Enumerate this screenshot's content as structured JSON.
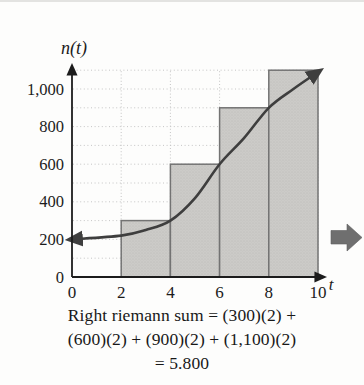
{
  "figure": {
    "caption_lines": [
      "Right riemann sum = (300)(2) +",
      "(600)(2) + (900)(2) + (1,100)(2)",
      "= 5.800"
    ]
  },
  "icons": {
    "continue_arrow": {
      "name": "right-block-arrow",
      "color": "#6f6f6f"
    }
  },
  "chart_data": {
    "type": "bar",
    "title": "",
    "xlabel": "t",
    "ylabel": "n(t)",
    "xlim": [
      0,
      10.3
    ],
    "ylim": [
      0,
      1150
    ],
    "x_ticks": {
      "values": [
        0,
        2,
        4,
        6,
        8,
        10
      ],
      "labels": [
        "0",
        "2",
        "4",
        "6",
        "8",
        "10"
      ]
    },
    "y_ticks": {
      "values": [
        0,
        200,
        400,
        600,
        800,
        1000
      ],
      "labels": [
        "0",
        "200",
        "400",
        "600",
        "800",
        "1,000"
      ]
    },
    "grid": {
      "on": true,
      "horizontal_values": [
        100,
        200,
        300,
        400,
        500,
        600,
        700,
        800,
        900,
        1000,
        1100
      ],
      "vertical_values": [
        2,
        4,
        6,
        8,
        10
      ]
    },
    "bars": [
      {
        "x_start": 2,
        "x_end": 4,
        "height": 300
      },
      {
        "x_start": 4,
        "x_end": 6,
        "height": 600
      },
      {
        "x_start": 6,
        "x_end": 8,
        "height": 900
      },
      {
        "x_start": 8,
        "x_end": 10,
        "height": 1100
      }
    ],
    "curve": {
      "description": "S-shaped growth curve n(t) with arrowheads at both ends",
      "points": [
        [
          0,
          200
        ],
        [
          2,
          220
        ],
        [
          3,
          250
        ],
        [
          4,
          300
        ],
        [
          5,
          420
        ],
        [
          6,
          600
        ],
        [
          7,
          740
        ],
        [
          8,
          900
        ],
        [
          9,
          1000
        ],
        [
          10,
          1090
        ]
      ]
    },
    "colors": {
      "bar_fill": "#cccbc8",
      "bar_stroke": "#737373",
      "curve": "#3e3e3e",
      "grid": "#bfbfbf",
      "axis": "#1c1c1c"
    }
  }
}
